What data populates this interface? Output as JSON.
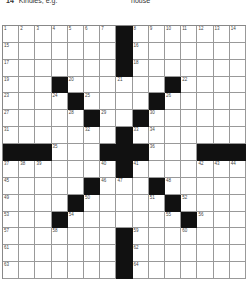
{
  "top_clues": [
    {
      "number": "14",
      "text": "Kindles, e.g.",
      "x": 6
    },
    {
      "number": "",
      "text": "house",
      "x": 131
    }
  ],
  "grid": {
    "size": 15,
    "rows": [
      {
        "black": [
          7
        ],
        "numbers": {
          "0": "1",
          "1": "2",
          "2": "3",
          "3": "4",
          "4": "5",
          "5": "6",
          "6": "7",
          "8": "8",
          "9": "9",
          "10": "10",
          "11": "11",
          "12": "12",
          "13": "13",
          "14": "14"
        }
      },
      {
        "black": [
          7
        ],
        "numbers": {
          "0": "15",
          "8": "16"
        }
      },
      {
        "black": [
          7
        ],
        "numbers": {
          "0": "17",
          "8": "18"
        }
      },
      {
        "black": [
          3,
          10
        ],
        "numbers": {
          "0": "19",
          "4": "20",
          "7": "21",
          "11": "22"
        }
      },
      {
        "black": [
          4,
          9
        ],
        "numbers": {
          "0": "23",
          "3": "24",
          "5": "25",
          "10": "26"
        }
      },
      {
        "black": [
          5,
          8
        ],
        "numbers": {
          "0": "27",
          "4": "28",
          "6": "29",
          "9": "30"
        }
      },
      {
        "black": [
          7
        ],
        "numbers": {
          "0": "31",
          "5": "32",
          "8": "33",
          "9": "34"
        }
      },
      {
        "black": [
          0,
          1,
          2,
          6,
          7,
          8,
          12,
          13,
          14
        ],
        "numbers": {
          "3": "35",
          "9": "36"
        }
      },
      {
        "black": [
          7
        ],
        "numbers": {
          "0": "37",
          "1": "38",
          "2": "39",
          "6": "40",
          "8": "41",
          "12": "42",
          "13": "43",
          "14": "44"
        }
      },
      {
        "black": [
          5,
          9
        ],
        "numbers": {
          "0": "45",
          "6": "46",
          "7": "47",
          "10": "48"
        }
      },
      {
        "black": [
          4,
          10
        ],
        "numbers": {
          "0": "49",
          "5": "50",
          "9": "51",
          "11": "52"
        }
      },
      {
        "black": [
          3,
          11
        ],
        "numbers": {
          "0": "53",
          "4": "54",
          "10": "55",
          "12": "56"
        }
      },
      {
        "black": [
          7
        ],
        "numbers": {
          "0": "57",
          "3": "58",
          "8": "59",
          "11": "60"
        }
      },
      {
        "black": [
          7
        ],
        "numbers": {
          "0": "61",
          "8": "62"
        }
      },
      {
        "black": [
          7
        ],
        "numbers": {
          "0": "63",
          "8": "64"
        }
      }
    ]
  }
}
